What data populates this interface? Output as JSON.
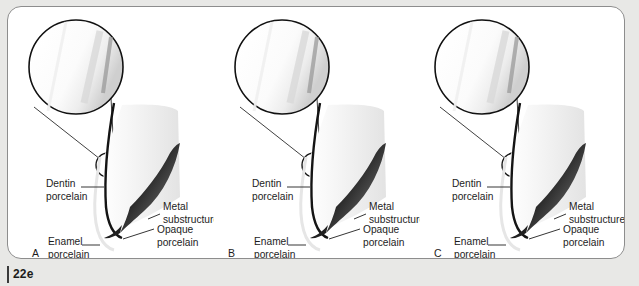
{
  "figure": {
    "caption_number": "22e",
    "background_color": "#e8e8e6",
    "frame_color": "#8d8d8d",
    "panel_fill": "#ffffff",
    "metal_color": "#1a1a1a",
    "porcelain_color": "#f2f2f2",
    "label_color": "#1d1d1d"
  },
  "panels": [
    {
      "id": "A",
      "letter": "A",
      "labels": {
        "dentin": {
          "line1": "Dentin",
          "line2": "porcelain"
        },
        "enamel": {
          "line1": "Enamel",
          "line2": "porcelain"
        },
        "metal": {
          "line1": "Metal",
          "line2": "substructure"
        },
        "opaque": {
          "line1": "Opaque",
          "line2": "porcelain"
        }
      }
    },
    {
      "id": "B",
      "letter": "B",
      "labels": {
        "dentin": {
          "line1": "Dentin",
          "line2": "porcelain"
        },
        "enamel": {
          "line1": "Enamel",
          "line2": "porcelain"
        },
        "metal": {
          "line1": "Metal",
          "line2": "substructure"
        },
        "opaque": {
          "line1": "Opaque",
          "line2": "porcelain"
        }
      }
    },
    {
      "id": "C",
      "letter": "C",
      "labels": {
        "dentin": {
          "line1": "Dentin",
          "line2": "porcelain"
        },
        "enamel": {
          "line1": "Enamel",
          "line2": "porcelain"
        },
        "metal": {
          "line1": "Metal",
          "line2": "substructure"
        },
        "opaque": {
          "line1": "Opaque",
          "line2": "porcelain"
        }
      }
    }
  ]
}
